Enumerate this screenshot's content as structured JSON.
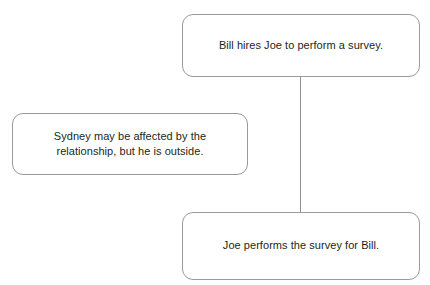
{
  "diagram": {
    "type": "flowchart",
    "background_color": "#ffffff",
    "node_border_color": "#9a9a9a",
    "connector_color": "#8f8f8f",
    "text_color": "#231f20",
    "nodes": [
      {
        "id": "node-top",
        "label": "Bill hires Joe to perform a survey."
      },
      {
        "id": "node-side",
        "label": "Sydney may be affected by the\nrelationship, but he is outside."
      },
      {
        "id": "node-bottom",
        "label": "Joe performs the survey for Bill."
      }
    ],
    "connectors": [
      {
        "id": "connector-top-bottom",
        "from": "node-top",
        "to": "node-bottom",
        "orientation": "vertical"
      }
    ]
  }
}
